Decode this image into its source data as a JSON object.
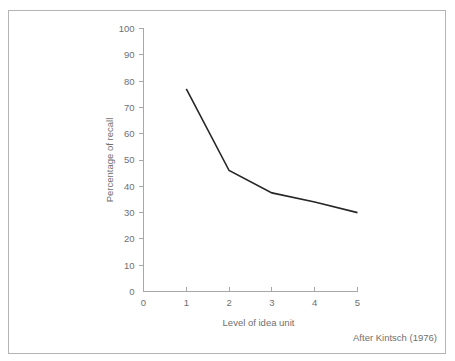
{
  "figure": {
    "attribution": "After Kintsch (1976)",
    "frame_color": "#b4b4b4",
    "axis_color": "#a8a8a8",
    "label_color": "#6f6f6f",
    "line_color": "#262626",
    "background": "#ffffff"
  },
  "chart_data": {
    "type": "line",
    "title": "",
    "subtitle": "",
    "xlabel": "Level of idea unit",
    "ylabel": "Percentage of recall",
    "x": [
      1,
      2,
      3,
      4,
      5
    ],
    "values": [
      77,
      46,
      37.5,
      34,
      30
    ],
    "series": [
      {
        "name": "Percentage of recall",
        "x": [
          1,
          2,
          3,
          4,
          5
        ],
        "values": [
          77,
          46,
          37.5,
          34,
          30
        ]
      }
    ],
    "xlim": [
      0,
      5
    ],
    "ylim": [
      0,
      100
    ],
    "xticks": [
      0,
      1,
      2,
      3,
      4,
      5
    ],
    "xtick_labels": [
      "0",
      "1",
      "2",
      "3",
      "4",
      "5"
    ],
    "yticks": [
      0,
      10,
      20,
      30,
      40,
      50,
      60,
      70,
      80,
      90,
      100
    ],
    "ytick_labels": [
      "0",
      "10",
      "20",
      "30",
      "40",
      "50",
      "60",
      "70",
      "80",
      "90",
      "100"
    ],
    "grid": false,
    "legend": false,
    "legend_position": "none",
    "annotations": [
      "After Kintsch (1976)"
    ]
  },
  "yaxis": {
    "label": "Percentage of recall",
    "ticks": [
      {
        "value": 100,
        "label": "100"
      },
      {
        "value": 90,
        "label": "90"
      },
      {
        "value": 80,
        "label": "80"
      },
      {
        "value": 70,
        "label": "70"
      },
      {
        "value": 60,
        "label": "60"
      },
      {
        "value": 50,
        "label": "50"
      },
      {
        "value": 40,
        "label": "40"
      },
      {
        "value": 30,
        "label": "30"
      },
      {
        "value": 20,
        "label": "20"
      },
      {
        "value": 10,
        "label": "10"
      },
      {
        "value": 0,
        "label": "0"
      }
    ]
  },
  "xaxis": {
    "label": "Level of idea unit",
    "ticks": [
      {
        "value": 0,
        "label": "0"
      },
      {
        "value": 1,
        "label": "1"
      },
      {
        "value": 2,
        "label": "2"
      },
      {
        "value": 3,
        "label": "3"
      },
      {
        "value": 4,
        "label": "4"
      },
      {
        "value": 5,
        "label": "5"
      }
    ]
  }
}
